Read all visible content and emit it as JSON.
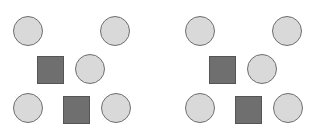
{
  "colors": {
    "circle_fill": "#d9d9d9",
    "circle_stroke": "#6e6e6e",
    "square_fill": "#6f6f6f",
    "square_stroke": "#555555",
    "background": "#ffffff"
  },
  "panels": [
    {
      "offset_x": 0,
      "shapes": [
        {
          "type": "circle",
          "x": 13,
          "y": 16,
          "w": 30,
          "h": 30
        },
        {
          "type": "circle",
          "x": 100,
          "y": 16,
          "w": 30,
          "h": 30
        },
        {
          "type": "square",
          "x": 37,
          "y": 56,
          "w": 27,
          "h": 28
        },
        {
          "type": "circle",
          "x": 75,
          "y": 54,
          "w": 30,
          "h": 30
        },
        {
          "type": "circle",
          "x": 13,
          "y": 93,
          "w": 30,
          "h": 30
        },
        {
          "type": "square",
          "x": 63,
          "y": 96,
          "w": 27,
          "h": 28
        },
        {
          "type": "circle",
          "x": 101,
          "y": 93,
          "w": 30,
          "h": 30
        }
      ]
    },
    {
      "offset_x": 172,
      "shapes": [
        {
          "type": "circle",
          "x": 13,
          "y": 16,
          "w": 30,
          "h": 30
        },
        {
          "type": "circle",
          "x": 100,
          "y": 16,
          "w": 30,
          "h": 30
        },
        {
          "type": "square",
          "x": 37,
          "y": 56,
          "w": 27,
          "h": 28
        },
        {
          "type": "circle",
          "x": 75,
          "y": 54,
          "w": 30,
          "h": 30
        },
        {
          "type": "circle",
          "x": 13,
          "y": 93,
          "w": 30,
          "h": 30
        },
        {
          "type": "square",
          "x": 63,
          "y": 96,
          "w": 27,
          "h": 28
        },
        {
          "type": "circle",
          "x": 101,
          "y": 93,
          "w": 30,
          "h": 30
        }
      ]
    }
  ]
}
